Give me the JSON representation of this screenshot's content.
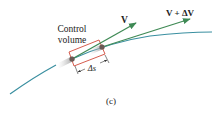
{
  "figure": {
    "panel_label": "(c)",
    "control_volume_label_line1": "Control",
    "control_volume_label_line2": "volume",
    "vector_v_label": "V",
    "vector_v_plus_dv_label": "V + ΔV",
    "length_label": "Δs"
  },
  "colors": {
    "streamline": "#3a8fa0",
    "vector": "#3f8a55",
    "control_volume": "#d04a3a",
    "particle": "#6a5a55",
    "text": "#222222"
  }
}
